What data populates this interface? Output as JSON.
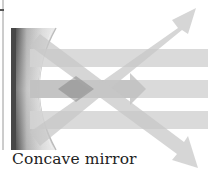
{
  "diagram": {
    "caption": "Concave mirror",
    "colors": {
      "background": "#ffffff",
      "beam": "#c8c8c8",
      "beam_overlap": "#8e8e8e",
      "mirror_dark": "#4a4a4a",
      "mirror_light": "#e2e2e2",
      "frame_line": "#9a9a9a",
      "caption_text": "#222222"
    },
    "elements": {
      "mirror": "concave-mirror",
      "incoming_beams": 3,
      "reflected_beams": 2,
      "arrows": [
        "up-right",
        "right",
        "down-right"
      ]
    }
  }
}
